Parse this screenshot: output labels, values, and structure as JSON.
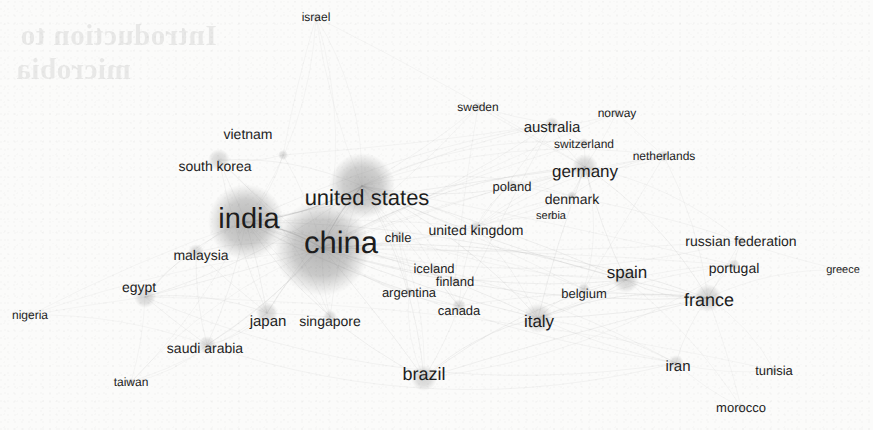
{
  "figure": {
    "kind": "network-graph",
    "title": "",
    "background_color": "#fbfbfa",
    "node_color": "#8c8c8c",
    "edge_color": "#a9a9a9",
    "label_color": "#1d1d1d",
    "bleed_through_line_1": "Introduction to",
    "bleed_through_line_2": "microbia"
  },
  "chart_data": {
    "type": "scatter",
    "title": "",
    "xlabel": "",
    "ylabel": "",
    "legend": [],
    "grid": false,
    "nodes": [
      {
        "label": "china",
        "x": 322,
        "y": 248,
        "r": 48,
        "weight": 100,
        "font": 31,
        "lx": 341,
        "ly": 242
      },
      {
        "label": "india",
        "x": 246,
        "y": 222,
        "r": 38,
        "weight": 78,
        "font": 29,
        "lx": 249,
        "ly": 219
      },
      {
        "label": "united states",
        "x": 362,
        "y": 186,
        "r": 33,
        "weight": 70,
        "font": 22,
        "lx": 367,
        "ly": 198
      },
      {
        "label": "france",
        "x": 708,
        "y": 298,
        "r": 14,
        "weight": 26,
        "font": 18,
        "lx": 709,
        "ly": 300
      },
      {
        "label": "italy",
        "x": 538,
        "y": 318,
        "r": 15,
        "weight": 25,
        "font": 17,
        "lx": 539,
        "ly": 321
      },
      {
        "label": "spain",
        "x": 626,
        "y": 280,
        "r": 13,
        "weight": 23,
        "font": 17,
        "lx": 627,
        "ly": 272
      },
      {
        "label": "germany",
        "x": 585,
        "y": 167,
        "r": 13,
        "weight": 23,
        "font": 17,
        "lx": 585,
        "ly": 171
      },
      {
        "label": "brazil",
        "x": 424,
        "y": 378,
        "r": 13,
        "weight": 22,
        "font": 18,
        "lx": 424,
        "ly": 374
      },
      {
        "label": "japan",
        "x": 267,
        "y": 313,
        "r": 11,
        "weight": 18,
        "font": 15,
        "lx": 268,
        "ly": 321
      },
      {
        "label": "egypt",
        "x": 145,
        "y": 297,
        "r": 11,
        "weight": 18,
        "font": 14,
        "lx": 139,
        "ly": 287
      },
      {
        "label": "south korea",
        "x": 219,
        "y": 160,
        "r": 11,
        "weight": 17,
        "font": 14,
        "lx": 215,
        "ly": 166
      },
      {
        "label": "saudi arabia",
        "x": 207,
        "y": 345,
        "r": 9,
        "weight": 15,
        "font": 14,
        "lx": 205,
        "ly": 348
      },
      {
        "label": "malaysia",
        "x": 196,
        "y": 252,
        "r": 8,
        "weight": 14,
        "font": 14,
        "lx": 201,
        "ly": 255
      },
      {
        "label": "iran",
        "x": 676,
        "y": 363,
        "r": 8,
        "weight": 13,
        "font": 15,
        "lx": 678,
        "ly": 366
      },
      {
        "label": "singapore",
        "x": 330,
        "y": 317,
        "r": 7,
        "weight": 12,
        "font": 14,
        "lx": 330,
        "ly": 321
      },
      {
        "label": "canada",
        "x": 459,
        "y": 306,
        "r": 7,
        "weight": 12,
        "font": 13,
        "lx": 459,
        "ly": 310
      },
      {
        "label": "belgium",
        "x": 584,
        "y": 289,
        "r": 6,
        "weight": 11,
        "font": 13,
        "lx": 584,
        "ly": 293
      },
      {
        "label": "portugal",
        "x": 734,
        "y": 265,
        "r": 6,
        "weight": 11,
        "font": 14,
        "lx": 734,
        "ly": 268
      },
      {
        "label": "australia",
        "x": 552,
        "y": 124,
        "r": 7,
        "weight": 12,
        "font": 15,
        "lx": 552,
        "ly": 127
      },
      {
        "label": "united kingdom",
        "x": 476,
        "y": 227,
        "r": 6,
        "weight": 11,
        "font": 14,
        "lx": 476,
        "ly": 230
      },
      {
        "label": "vietnam",
        "x": 283,
        "y": 155,
        "r": 5,
        "weight": 9,
        "font": 14,
        "lx": 248,
        "ly": 134
      },
      {
        "label": "denmark",
        "x": 572,
        "y": 196,
        "r": 5,
        "weight": 9,
        "font": 14,
        "lx": 572,
        "ly": 199
      },
      {
        "label": "switzerland",
        "x": 584,
        "y": 143,
        "r": 5,
        "weight": 9,
        "font": 12,
        "lx": 584,
        "ly": 144
      },
      {
        "label": "netherlands",
        "x": 664,
        "y": 156,
        "r": 6,
        "weight": 10,
        "font": 12,
        "lx": 664,
        "ly": 156
      },
      {
        "label": "poland",
        "x": 512,
        "y": 185,
        "r": 5,
        "weight": 9,
        "font": 13,
        "lx": 512,
        "ly": 186
      },
      {
        "label": "russian federation",
        "x": 741,
        "y": 241,
        "r": 5,
        "weight": 9,
        "font": 14,
        "lx": 741,
        "ly": 241
      },
      {
        "label": "sweden",
        "x": 478,
        "y": 107,
        "r": 5,
        "weight": 9,
        "font": 12,
        "lx": 478,
        "ly": 107
      },
      {
        "label": "norway",
        "x": 617,
        "y": 113,
        "r": 4,
        "weight": 8,
        "font": 12,
        "lx": 617,
        "ly": 113
      },
      {
        "label": "chile",
        "x": 398,
        "y": 236,
        "r": 5,
        "weight": 8,
        "font": 13,
        "lx": 398,
        "ly": 237
      },
      {
        "label": "argentina",
        "x": 409,
        "y": 292,
        "r": 5,
        "weight": 8,
        "font": 13,
        "lx": 409,
        "ly": 292
      },
      {
        "label": "iceland",
        "x": 434,
        "y": 268,
        "r": 4,
        "weight": 8,
        "font": 13,
        "lx": 434,
        "ly": 268
      },
      {
        "label": "finland",
        "x": 455,
        "y": 281,
        "r": 4,
        "weight": 8,
        "font": 13,
        "lx": 455,
        "ly": 281
      },
      {
        "label": "serbia",
        "x": 551,
        "y": 216,
        "r": 4,
        "weight": 7,
        "font": 11,
        "lx": 551,
        "ly": 216
      },
      {
        "label": "israel",
        "x": 316,
        "y": 17,
        "r": 4,
        "weight": 7,
        "font": 12,
        "lx": 316,
        "ly": 17
      },
      {
        "label": "taiwan",
        "x": 131,
        "y": 382,
        "r": 4,
        "weight": 7,
        "font": 12,
        "lx": 131,
        "ly": 382
      },
      {
        "label": "nigeria",
        "x": 30,
        "y": 315,
        "r": 4,
        "weight": 7,
        "font": 12,
        "lx": 30,
        "ly": 315
      },
      {
        "label": "tunisia",
        "x": 774,
        "y": 370,
        "r": 4,
        "weight": 7,
        "font": 13,
        "lx": 774,
        "ly": 370
      },
      {
        "label": "morocco",
        "x": 741,
        "y": 407,
        "r": 4,
        "weight": 7,
        "font": 13,
        "lx": 741,
        "ly": 407
      },
      {
        "label": "greece",
        "x": 843,
        "y": 270,
        "r": 3,
        "weight": 6,
        "font": 11,
        "lx": 843,
        "ly": 270
      }
    ],
    "edges": [
      [
        "china",
        "india"
      ],
      [
        "china",
        "united states"
      ],
      [
        "china",
        "japan"
      ],
      [
        "china",
        "south korea"
      ],
      [
        "china",
        "singapore"
      ],
      [
        "china",
        "australia"
      ],
      [
        "china",
        "germany"
      ],
      [
        "china",
        "united kingdom"
      ],
      [
        "china",
        "canada"
      ],
      [
        "china",
        "france"
      ],
      [
        "china",
        "italy"
      ],
      [
        "china",
        "brazil"
      ],
      [
        "china",
        "spain"
      ],
      [
        "china",
        "malaysia"
      ],
      [
        "china",
        "egypt"
      ],
      [
        "china",
        "saudi arabia"
      ],
      [
        "china",
        "iran"
      ],
      [
        "china",
        "vietnam"
      ],
      [
        "china",
        "taiwan"
      ],
      [
        "china",
        "israel"
      ],
      [
        "china",
        "netherlands"
      ],
      [
        "china",
        "sweden"
      ],
      [
        "china",
        "denmark"
      ],
      [
        "china",
        "switzerland"
      ],
      [
        "china",
        "poland"
      ],
      [
        "china",
        "russian federation"
      ],
      [
        "china",
        "portugal"
      ],
      [
        "china",
        "belgium"
      ],
      [
        "china",
        "chile"
      ],
      [
        "china",
        "argentina"
      ],
      [
        "china",
        "finland"
      ],
      [
        "china",
        "norway"
      ],
      [
        "china",
        "nigeria"
      ],
      [
        "india",
        "united states"
      ],
      [
        "india",
        "south korea"
      ],
      [
        "india",
        "japan"
      ],
      [
        "india",
        "malaysia"
      ],
      [
        "india",
        "egypt"
      ],
      [
        "india",
        "saudi arabia"
      ],
      [
        "india",
        "germany"
      ],
      [
        "india",
        "united kingdom"
      ],
      [
        "india",
        "france"
      ],
      [
        "india",
        "italy"
      ],
      [
        "india",
        "brazil"
      ],
      [
        "india",
        "spain"
      ],
      [
        "india",
        "iran"
      ],
      [
        "india",
        "australia"
      ],
      [
        "india",
        "canada"
      ],
      [
        "india",
        "singapore"
      ],
      [
        "india",
        "taiwan"
      ],
      [
        "india",
        "nigeria"
      ],
      [
        "india",
        "israel"
      ],
      [
        "india",
        "vietnam"
      ],
      [
        "india",
        "russian federation"
      ],
      [
        "united states",
        "germany"
      ],
      [
        "united states",
        "united kingdom"
      ],
      [
        "united states",
        "france"
      ],
      [
        "united states",
        "italy"
      ],
      [
        "united states",
        "canada"
      ],
      [
        "united states",
        "brazil"
      ],
      [
        "united states",
        "spain"
      ],
      [
        "united states",
        "australia"
      ],
      [
        "united states",
        "japan"
      ],
      [
        "united states",
        "south korea"
      ],
      [
        "united states",
        "israel"
      ],
      [
        "united states",
        "netherlands"
      ],
      [
        "united states",
        "sweden"
      ],
      [
        "united states",
        "switzerland"
      ],
      [
        "united states",
        "denmark"
      ],
      [
        "united states",
        "belgium"
      ],
      [
        "united states",
        "chile"
      ],
      [
        "united states",
        "argentina"
      ],
      [
        "united states",
        "iceland"
      ],
      [
        "united states",
        "finland"
      ],
      [
        "united states",
        "singapore"
      ],
      [
        "united states",
        "saudi arabia"
      ],
      [
        "united states",
        "egypt"
      ],
      [
        "united states",
        "portugal"
      ],
      [
        "germany",
        "france"
      ],
      [
        "germany",
        "italy"
      ],
      [
        "germany",
        "spain"
      ],
      [
        "germany",
        "netherlands"
      ],
      [
        "germany",
        "switzerland"
      ],
      [
        "germany",
        "denmark"
      ],
      [
        "germany",
        "sweden"
      ],
      [
        "germany",
        "norway"
      ],
      [
        "germany",
        "poland"
      ],
      [
        "germany",
        "serbia"
      ],
      [
        "germany",
        "austria"
      ],
      [
        "germany",
        "belgium"
      ],
      [
        "germany",
        "united kingdom"
      ],
      [
        "germany",
        "australia"
      ],
      [
        "germany",
        "russian federation"
      ],
      [
        "france",
        "spain"
      ],
      [
        "france",
        "italy"
      ],
      [
        "france",
        "portugal"
      ],
      [
        "france",
        "belgium"
      ],
      [
        "france",
        "tunisia"
      ],
      [
        "france",
        "morocco"
      ],
      [
        "france",
        "iran"
      ],
      [
        "france",
        "russian federation"
      ],
      [
        "france",
        "greece"
      ],
      [
        "france",
        "brazil"
      ],
      [
        "france",
        "canada"
      ],
      [
        "france",
        "netherlands"
      ],
      [
        "italy",
        "spain"
      ],
      [
        "italy",
        "belgium"
      ],
      [
        "italy",
        "brazil"
      ],
      [
        "italy",
        "portugal"
      ],
      [
        "italy",
        "united kingdom"
      ],
      [
        "italy",
        "france"
      ],
      [
        "italy",
        "iran"
      ],
      [
        "spain",
        "portugal"
      ],
      [
        "spain",
        "belgium"
      ],
      [
        "spain",
        "brazil"
      ],
      [
        "spain",
        "argentina"
      ],
      [
        "spain",
        "chile"
      ],
      [
        "spain",
        "morocco"
      ],
      [
        "brazil",
        "argentina"
      ],
      [
        "brazil",
        "chile"
      ],
      [
        "brazil",
        "canada"
      ],
      [
        "brazil",
        "portugal"
      ],
      [
        "egypt",
        "saudi arabia"
      ],
      [
        "egypt",
        "nigeria"
      ],
      [
        "egypt",
        "malaysia"
      ],
      [
        "egypt",
        "taiwan"
      ],
      [
        "egypt",
        "japan"
      ],
      [
        "egypt",
        "iran"
      ],
      [
        "egypt",
        "tunisia"
      ],
      [
        "saudi arabia",
        "malaysia"
      ],
      [
        "saudi arabia",
        "taiwan"
      ],
      [
        "saudi arabia",
        "japan"
      ],
      [
        "saudi arabia",
        "iran"
      ],
      [
        "saudi arabia",
        "nigeria"
      ],
      [
        "japan",
        "south korea"
      ],
      [
        "japan",
        "singapore"
      ],
      [
        "japan",
        "taiwan"
      ],
      [
        "japan",
        "malaysia"
      ],
      [
        "south korea",
        "vietnam"
      ],
      [
        "south korea",
        "singapore"
      ],
      [
        "australia",
        "united kingdom"
      ],
      [
        "australia",
        "sweden"
      ],
      [
        "australia",
        "norway"
      ],
      [
        "australia",
        "switzerland"
      ],
      [
        "australia",
        "canada"
      ],
      [
        "united kingdom",
        "netherlands"
      ],
      [
        "united kingdom",
        "denmark"
      ],
      [
        "united kingdom",
        "poland"
      ],
      [
        "united kingdom",
        "serbia"
      ],
      [
        "united kingdom",
        "canada"
      ],
      [
        "iran",
        "morocco"
      ],
      [
        "iran",
        "tunisia"
      ],
      [
        "iran",
        "italy"
      ],
      [
        "russian federation",
        "portugal"
      ],
      [
        "russian federation",
        "greece"
      ],
      [
        "russian federation",
        "poland"
      ],
      [
        "netherlands",
        "belgium"
      ],
      [
        "netherlands",
        "norway"
      ],
      [
        "netherlands",
        "denmark"
      ],
      [
        "israel",
        "united states"
      ],
      [
        "israel",
        "germany"
      ],
      [
        "iceland",
        "finland"
      ],
      [
        "iceland",
        "canada"
      ],
      [
        "finland",
        "sweden"
      ],
      [
        "chile",
        "argentina"
      ],
      [
        "canada",
        "iceland"
      ],
      [
        "vietnam",
        "israel"
      ],
      [
        "vietnam",
        "australia"
      ]
    ]
  }
}
